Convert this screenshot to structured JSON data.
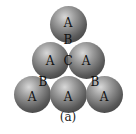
{
  "diagram": {
    "spheres": [
      {
        "label": "A",
        "row": 1
      },
      {
        "label": "A",
        "row": 2
      },
      {
        "label": "A",
        "row": 2
      },
      {
        "label": "A",
        "row": 3
      },
      {
        "label": "A",
        "row": 3
      },
      {
        "label": "A",
        "row": 3
      }
    ],
    "site_labels": {
      "b_top": "B",
      "c_center": "C",
      "b_left": "B",
      "b_right": "B"
    },
    "caption": "(a)"
  }
}
